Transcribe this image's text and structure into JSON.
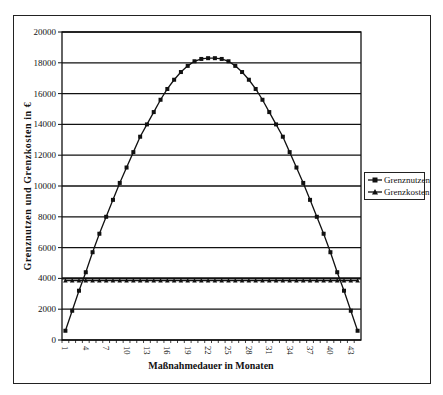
{
  "chart_data": {
    "type": "line",
    "title": "",
    "xlabel": "Maßnahmedauer in Monaten",
    "ylabel": "Grenznutzen und Grenzkosten in €",
    "ylim": [
      0,
      20000
    ],
    "yticks": [
      0,
      2000,
      4000,
      6000,
      8000,
      10000,
      12000,
      14000,
      16000,
      18000,
      20000
    ],
    "ytick_labels": [
      "0",
      "2000",
      "4000",
      "6000",
      "8000",
      "10000",
      "12000",
      "14000",
      "16000",
      "18000",
      "20000"
    ],
    "xlim": [
      1,
      44
    ],
    "xtick_labels": [
      "1",
      "4",
      "7",
      "10",
      "13",
      "16",
      "19",
      "22",
      "25",
      "28",
      "31",
      "34",
      "37",
      "40",
      "43"
    ],
    "grid": "horizontal",
    "legend_position": "right",
    "x": [
      1,
      2,
      3,
      4,
      5,
      6,
      7,
      8,
      9,
      10,
      11,
      12,
      13,
      14,
      15,
      16,
      17,
      18,
      19,
      20,
      21,
      22,
      23,
      24,
      25,
      26,
      27,
      28,
      29,
      30,
      31,
      32,
      33,
      34,
      35,
      36,
      37,
      38,
      39,
      40,
      41,
      42,
      43,
      44
    ],
    "series": [
      {
        "name": "Grenznutzen",
        "marker": "square",
        "values": [
          600,
          1900,
          3200,
          4400,
          5700,
          6900,
          8000,
          9100,
          10200,
          11200,
          12200,
          13200,
          14000,
          14800,
          15600,
          16300,
          16900,
          17400,
          17800,
          18100,
          18250,
          18300,
          18300,
          18250,
          18100,
          17800,
          17400,
          16900,
          16300,
          15600,
          14800,
          14000,
          13200,
          12200,
          11200,
          10200,
          9100,
          8000,
          6900,
          5700,
          4400,
          3200,
          1900,
          600
        ]
      },
      {
        "name": "Grenzkosten",
        "marker": "triangle",
        "values": [
          3850,
          3850,
          3850,
          3850,
          3850,
          3850,
          3850,
          3850,
          3850,
          3850,
          3850,
          3850,
          3850,
          3850,
          3850,
          3850,
          3850,
          3850,
          3850,
          3850,
          3850,
          3850,
          3850,
          3850,
          3850,
          3850,
          3850,
          3850,
          3850,
          3850,
          3850,
          3850,
          3850,
          3850,
          3850,
          3850,
          3850,
          3850,
          3850,
          3850,
          3850,
          3850,
          3850,
          3850
        ]
      }
    ]
  },
  "legend": {
    "items": [
      {
        "label": "Grenznutzen"
      },
      {
        "label": "Grenzkosten"
      }
    ]
  },
  "axes": {
    "xlabel": "Maßnahmedauer in Monaten",
    "ylabel": "Grenznutzen und Grenzkosten in €"
  },
  "colors": {
    "line": "#111111",
    "grid": "#111111",
    "background": "#ffffff"
  }
}
